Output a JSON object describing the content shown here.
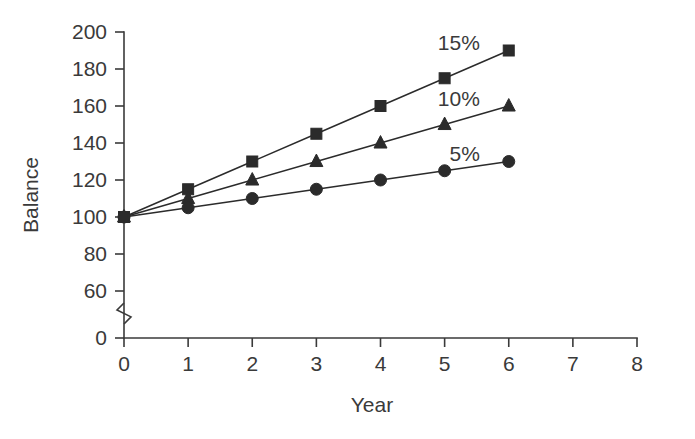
{
  "chart_data": {
    "type": "line",
    "title": "",
    "xlabel": "Year",
    "ylabel": "Balance",
    "x": [
      0,
      1,
      2,
      3,
      4,
      5,
      6
    ],
    "xlim": [
      0,
      8
    ],
    "xticks": [
      "0",
      "1",
      "2",
      "3",
      "4",
      "5",
      "6",
      "7",
      "8"
    ],
    "ylim": [
      0,
      200
    ],
    "yticks": [
      "200",
      "180",
      "160",
      "140",
      "120",
      "100",
      "80",
      "60",
      "0"
    ],
    "y_axis_break": true,
    "y_axis_break_between": [
      0,
      60
    ],
    "grid": false,
    "legend_position": "inline-right",
    "series": [
      {
        "name": "15%",
        "marker": "square",
        "color": "#2b2b2b",
        "values": [
          100,
          115,
          130,
          145,
          160,
          175,
          190
        ]
      },
      {
        "name": "10%",
        "marker": "triangle",
        "color": "#2b2b2b",
        "values": [
          100,
          110,
          120,
          130,
          140,
          150,
          160
        ]
      },
      {
        "name": "5%",
        "marker": "circle",
        "color": "#2b2b2b",
        "values": [
          100,
          105,
          110,
          115,
          120,
          125,
          130
        ]
      }
    ],
    "annotations": [
      {
        "text": "15%",
        "x": 5.55,
        "y": 194
      },
      {
        "text": "10%",
        "x": 5.55,
        "y": 164
      },
      {
        "text": "5%",
        "x": 5.55,
        "y": 134
      }
    ]
  }
}
